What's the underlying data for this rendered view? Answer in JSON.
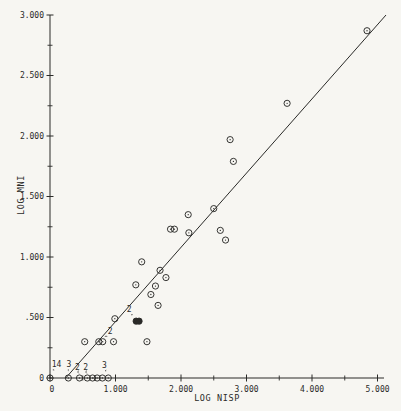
{
  "style": {
    "paper": "#f7f6f2",
    "ink": "#2a2a28"
  },
  "chart_data": {
    "type": "scatter",
    "title": "",
    "xlabel": "LOG NISP",
    "ylabel": "LOG MNI",
    "xlim": [
      0,
      5
    ],
    "ylim": [
      0,
      3
    ],
    "grid": false,
    "legend": null,
    "marker": "circled-dot",
    "x_major_ticks": [
      {
        "v": 0,
        "label": "0"
      },
      {
        "v": 1,
        "label": "1.000"
      },
      {
        "v": 2,
        "label": "2.000"
      },
      {
        "v": 3,
        "label": "3.000"
      },
      {
        "v": 4,
        "label": "4.000"
      },
      {
        "v": 5,
        "label": "5.000"
      }
    ],
    "x_minor_ticks": [
      0.5,
      1.5,
      2.5,
      3.5,
      4.5
    ],
    "y_major_ticks": [
      {
        "v": 0,
        "label": "0"
      },
      {
        "v": 0.5,
        "label": ".500"
      },
      {
        "v": 1,
        "label": "1.000"
      },
      {
        "v": 1.5,
        "label": "1.500"
      },
      {
        "v": 2,
        "label": "2.000"
      },
      {
        "v": 2.5,
        "label": "2.500"
      },
      {
        "v": 3,
        "label": "3.000"
      }
    ],
    "y_minor_ticks": [
      0.25,
      0.75,
      1.25,
      1.75,
      2.25,
      2.75
    ],
    "regression_line": {
      "x1": 0.24,
      "y1": 0.0,
      "x2": 5.13,
      "y2": 3.0
    },
    "points": [
      {
        "x": 0.0,
        "y": 0.0,
        "count": 14
      },
      {
        "x": 0.28,
        "y": 0.0,
        "count": 3
      },
      {
        "x": 0.45,
        "y": 0.0,
        "count": 2
      },
      {
        "x": 0.57,
        "y": 0.0,
        "count": 2
      },
      {
        "x": 0.65,
        "y": 0.0
      },
      {
        "x": 0.72,
        "y": 0.0
      },
      {
        "x": 0.8,
        "y": 0.0
      },
      {
        "x": 0.89,
        "y": 0.0,
        "count": 3
      },
      {
        "x": 0.53,
        "y": 0.3
      },
      {
        "x": 0.745,
        "y": 0.3,
        "count": 2
      },
      {
        "x": 0.805,
        "y": 0.3
      },
      {
        "x": 0.97,
        "y": 0.3
      },
      {
        "x": 1.48,
        "y": 0.3
      },
      {
        "x": 0.99,
        "y": 0.49
      },
      {
        "x": 1.315,
        "y": 0.47,
        "count": 2,
        "filled": true
      },
      {
        "x": 1.36,
        "y": 0.47,
        "filled": true
      },
      {
        "x": 1.31,
        "y": 0.77
      },
      {
        "x": 1.4,
        "y": 0.96
      },
      {
        "x": 1.54,
        "y": 0.69
      },
      {
        "x": 1.61,
        "y": 0.76
      },
      {
        "x": 1.65,
        "y": 0.6
      },
      {
        "x": 1.68,
        "y": 0.89
      },
      {
        "x": 1.77,
        "y": 0.83
      },
      {
        "x": 1.84,
        "y": 1.23
      },
      {
        "x": 1.9,
        "y": 1.23
      },
      {
        "x": 2.11,
        "y": 1.35
      },
      {
        "x": 2.12,
        "y": 1.2
      },
      {
        "x": 2.5,
        "y": 1.4
      },
      {
        "x": 2.6,
        "y": 1.22
      },
      {
        "x": 2.68,
        "y": 1.14
      },
      {
        "x": 2.75,
        "y": 1.97
      },
      {
        "x": 2.8,
        "y": 1.79
      },
      {
        "x": 3.62,
        "y": 2.27
      },
      {
        "x": 4.84,
        "y": 2.87
      }
    ],
    "annotations": [
      {
        "label": "14",
        "lx": 0.1,
        "ly": 0.105,
        "px": 0.01,
        "py": 0.035
      },
      {
        "label": "3",
        "lx": 0.29,
        "ly": 0.105,
        "px": 0.28,
        "py": 0.035
      },
      {
        "label": "2",
        "lx": 0.42,
        "ly": 0.082,
        "px": 0.455,
        "py": 0.028
      },
      {
        "label": "2",
        "lx": 0.545,
        "ly": 0.082,
        "px": 0.575,
        "py": 0.028
      },
      {
        "label": "3",
        "lx": 0.83,
        "ly": 0.098,
        "px": 0.885,
        "py": 0.035
      },
      {
        "label": "2",
        "lx": 0.92,
        "ly": 0.378,
        "px": 0.79,
        "py": 0.315
      },
      {
        "label": "2",
        "lx": 1.21,
        "ly": 0.565,
        "px": 1.3,
        "py": 0.495
      }
    ]
  }
}
